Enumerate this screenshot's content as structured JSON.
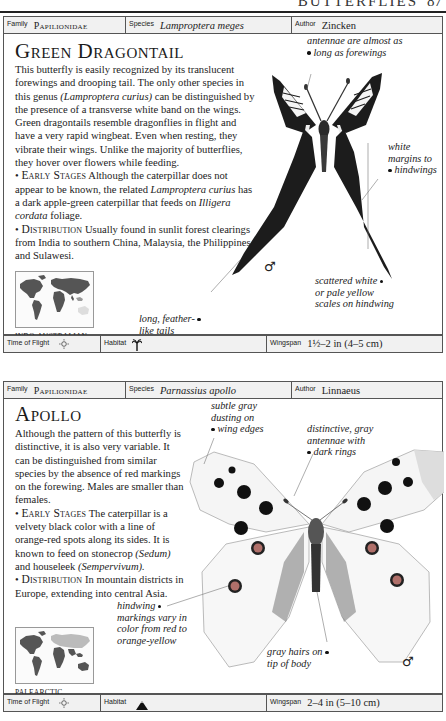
{
  "running_head": {
    "title": "BUTTERFLIES",
    "page_number": "87"
  },
  "entries": [
    {
      "meta": {
        "family_label": "Family",
        "family": "Papilionidae",
        "species_label": "Species",
        "species": "Lamproptera meges",
        "author_label": "Author",
        "author": "Zincken"
      },
      "title": "Green Dragontail",
      "body": {
        "p1_a": "This butterfly is easily recognized by its translucent forewings and drooping tail. The only other species in this genus ",
        "p1_it": "(Lamproptera curius)",
        "p1_b": " can be distinguished by the presence of a transverse white band on the wings. Green dragontails resemble dragonflies in flight and have a very rapid wingbeat. Even when resting, they vibrate their wings. Unlike the majority of butterflies, they hover over flowers while feeding.",
        "early_bullet": "•",
        "early_heading": "Early Stages",
        "early_a": " Although the caterpillar does not appear to be known, the related ",
        "early_it1": "Lamproptera curius",
        "early_b": " has a dark apple-green caterpillar that feeds on ",
        "early_it2": "Illigera cordata",
        "early_c": " foliage.",
        "dist_bullet": "•",
        "dist_heading": "Distribution",
        "dist_text": " Usually found in sunlit forest clearings from India to southern China, Malaysia, the Philippines, and Sulawesi."
      },
      "map_label": "INDO-AUSTRALIAN",
      "captions": {
        "antennae": "antennae are almost as long as forewings",
        "antennae_l1": "antennae are almost as",
        "antennae_l2": "long as forewings",
        "white_l1": "white",
        "white_l2": "margins to",
        "white_l3": "hindwings",
        "scattered_l1": "scattered white",
        "scattered_l2": "or pale yellow",
        "scattered_l3": "scales on hindwing",
        "tails_l1": "long, feather-",
        "tails_l2": "like tails"
      },
      "sex_symbol": "♂",
      "footer": {
        "time_label": "Time of Flight",
        "time_icon": "sun-icon",
        "habitat_label": "Habitat",
        "habitat_icon": "palm-tree-icon",
        "wingspan_label": "Wingspan",
        "wingspan": "1½–2 in (4–5 cm)"
      }
    },
    {
      "meta": {
        "family_label": "Family",
        "family": "Papilionidae",
        "species_label": "Species",
        "species": "Parnassius apollo",
        "author_label": "Author",
        "author": "Linnaeus"
      },
      "title": "Apollo",
      "body": {
        "p1": "Although the pattern of this butterfly is distinctive, it is also very variable. It can be distinguished from similar species by the absence of red markings on the forewing. Males are smaller than females.",
        "early_bullet": "•",
        "early_heading": "Early Stages",
        "early_a": " The caterpillar is a velvety black color with a line of orange-red spots along its sides. It is known to feed on stonecrop ",
        "early_it1": "(Sedum)",
        "early_b": " and houseleek ",
        "early_it2": "(Sempervivum).",
        "dist_bullet": "•",
        "dist_heading": "Distribution",
        "dist_text": " In mountain districts in Europe, extending into central Asia."
      },
      "map_label": "PALEARCTIC",
      "captions": {
        "dusting_l1": "subtle gray",
        "dusting_l2": "dusting on",
        "dusting_l3": "wing edges",
        "antennae_l1": "distinctive, gray",
        "antennae_l2": "antennae with",
        "antennae_l3": "dark rings",
        "hindwing_l1": "hindwing",
        "hindwing_l2": "markings vary in",
        "hindwing_l3": "color from red to",
        "hindwing_l4": "orange-yellow",
        "hairs_l1": "gray hairs on",
        "hairs_l2": "tip of body"
      },
      "sex_symbol": "♂",
      "footer": {
        "time_label": "Time of Flight",
        "time_icon": "sun-icon",
        "habitat_label": "Habitat",
        "habitat_icon": "mountain-icon",
        "wingspan_label": "Wingspan",
        "wingspan": "2–4 in (5–10 cm)"
      }
    }
  ],
  "colors": {
    "rule": "#222222",
    "meta_bg": "#f1f1f1",
    "border": "#555555",
    "map_land": "#555555",
    "map_highlight": "#bbbbbb",
    "dragontail_wing": "#1c1c1c",
    "apollo_spot_red": "#b0706a"
  }
}
